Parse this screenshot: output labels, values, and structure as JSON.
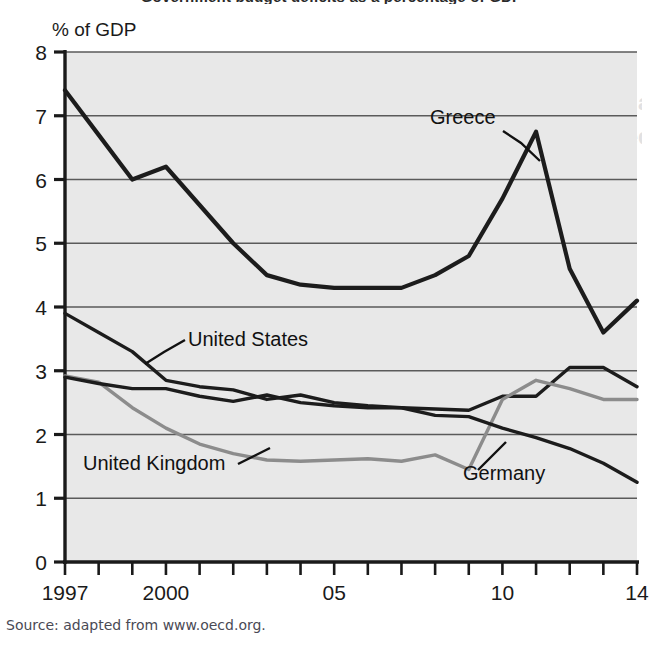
{
  "figure": {
    "title_partial": "Government budget deficits as a percentage of GDP",
    "source_note": "Source: adapted from www.oecd.org.",
    "ghost_text": [
      "Government budget deficit as a",
      "percentage of GDP: selected",
      "countries 1997–14"
    ],
    "plot_background": "#e8e8e8",
    "page_background": "#ffffff"
  },
  "chart_data": {
    "type": "line",
    "title": "Government budget deficits as a percentage of GDP",
    "xlabel": "",
    "ylabel": "% of GDP",
    "ylim": [
      0,
      8
    ],
    "xlim": [
      1997,
      2014
    ],
    "grid": true,
    "legend": "inline-annotations",
    "ytick_labels": [
      "0",
      "1",
      "2",
      "3",
      "4",
      "5",
      "6",
      "7",
      "8"
    ],
    "ytick_values": [
      0,
      1,
      2,
      3,
      4,
      5,
      6,
      7,
      8
    ],
    "xtick_values": [
      1997,
      1998,
      1999,
      2000,
      2001,
      2002,
      2003,
      2004,
      2005,
      2006,
      2007,
      2008,
      2009,
      2010,
      2011,
      2012,
      2013,
      2014
    ],
    "xtick_labels": [
      {
        "value": 1997,
        "label": "1997"
      },
      {
        "value": 2000,
        "label": "2000"
      },
      {
        "value": 2005,
        "label": "05"
      },
      {
        "value": 2010,
        "label": "10"
      },
      {
        "value": 2014,
        "label": "14"
      }
    ],
    "x": [
      1997,
      1998,
      1999,
      2000,
      2001,
      2002,
      2003,
      2004,
      2005,
      2006,
      2007,
      2008,
      2009,
      2010,
      2011,
      2012,
      2013,
      2014
    ],
    "series": [
      {
        "name": "Greece",
        "color": "#1c1c1c",
        "width": 4.2,
        "values": [
          7.4,
          6.7,
          6.0,
          6.2,
          5.6,
          5.0,
          4.5,
          4.35,
          4.3,
          4.3,
          4.3,
          4.5,
          4.8,
          5.7,
          6.75,
          4.6,
          3.6,
          4.1
        ],
        "label_text": "Greece",
        "label_x": 430,
        "label_y": 124,
        "leader": [
          [
            503,
            131
          ],
          [
            521,
            143
          ],
          [
            540,
            161
          ]
        ]
      },
      {
        "name": "United States",
        "color": "#1c1c1c",
        "width": 3.4,
        "values": [
          3.9,
          3.6,
          3.3,
          2.85,
          2.75,
          2.7,
          2.55,
          2.62,
          2.5,
          2.45,
          2.42,
          2.4,
          2.38,
          2.6,
          2.6,
          3.05,
          3.05,
          2.75
        ],
        "label_text": "United States",
        "label_x": 188,
        "label_y": 346,
        "leader": [
          [
            185,
            340
          ],
          [
            164,
            352
          ],
          [
            145,
            364
          ]
        ]
      },
      {
        "name": "United Kingdom",
        "color": "#8c8c8c",
        "width": 3.4,
        "values": [
          2.92,
          2.82,
          2.42,
          2.1,
          1.85,
          1.7,
          1.6,
          1.58,
          1.6,
          1.62,
          1.58,
          1.68,
          1.45,
          2.55,
          2.85,
          2.72,
          2.55,
          2.55
        ],
        "label_text": "United Kingdom",
        "label_x": 83,
        "label_y": 470,
        "leader": [
          [
            238,
            464
          ],
          [
            254,
            456
          ],
          [
            270,
            448
          ]
        ]
      },
      {
        "name": "Germany",
        "color": "#1c1c1c",
        "width": 3.4,
        "values": [
          2.9,
          2.8,
          2.72,
          2.72,
          2.6,
          2.52,
          2.62,
          2.5,
          2.45,
          2.42,
          2.42,
          2.3,
          2.28,
          2.1,
          1.95,
          1.78,
          1.55,
          1.25
        ],
        "label_text": "Germany",
        "label_x": 463,
        "label_y": 480,
        "leader": [
          [
            478,
            470
          ],
          [
            492,
            456
          ],
          [
            506,
            442
          ]
        ]
      }
    ]
  },
  "axis": {
    "y_unit_label": "% of GDP",
    "y_unit_label_x": 52,
    "y_unit_label_y": 36
  }
}
